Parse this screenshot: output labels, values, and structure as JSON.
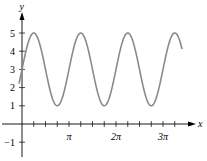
{
  "chart_data": {
    "type": "line",
    "title": "",
    "xlabel": "x",
    "ylabel": "y",
    "function": "y = 3 + 2 sin(2x)",
    "xlim": [
      -0.2,
      10.7
    ],
    "ylim": [
      -1.2,
      5.5
    ],
    "x_minor_tick_step_over_pi": 0.25,
    "x_tick_labels": [
      {
        "value_over_pi": 1,
        "label": "π"
      },
      {
        "value_over_pi": 2,
        "label": "2π"
      },
      {
        "value_over_pi": 3,
        "label": "3π"
      }
    ],
    "y_ticks": [
      {
        "value": -1,
        "label": "−1"
      },
      {
        "value": 1,
        "label": "1"
      },
      {
        "value": 2,
        "label": "2"
      },
      {
        "value": 3,
        "label": "3"
      },
      {
        "value": 4,
        "label": "4"
      },
      {
        "value": 5,
        "label": "5"
      }
    ],
    "series": [
      {
        "name": "y = 3 + 2 sin(2x)",
        "color": "#8a8a8a",
        "x_start": -0.2,
        "x_end": 10.7,
        "amplitude": 2,
        "midline": 3,
        "angular_frequency": 2,
        "key_points": [
          {
            "x": 0,
            "y": 3
          },
          {
            "x": 0.785,
            "y": 5
          },
          {
            "x": 2.356,
            "y": 1
          },
          {
            "x": 3.927,
            "y": 5
          },
          {
            "x": 5.498,
            "y": 1
          },
          {
            "x": 7.069,
            "y": 5
          },
          {
            "x": 8.639,
            "y": 1
          },
          {
            "x": 10.21,
            "y": 5
          }
        ]
      }
    ],
    "grid": false,
    "legend": "none"
  }
}
